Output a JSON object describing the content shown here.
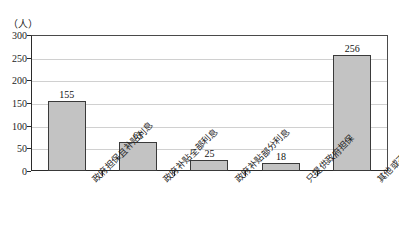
{
  "chart_data": {
    "type": "bar",
    "title": "",
    "subtitle": "",
    "xlabel": "",
    "ylabel": "",
    "unit_label": "（人）",
    "categories": [
      "政府担保且补贴利息",
      "政府补贴全部利息",
      "政府补贴部分利息",
      "只提供政府担保",
      "其他或不考虑"
    ],
    "values": [
      155,
      65,
      25,
      18,
      256
    ],
    "value_labels": [
      "155",
      "65",
      "25",
      "18",
      "256"
    ],
    "ylim": [
      0,
      300
    ],
    "yticks": [
      0,
      50,
      100,
      150,
      200,
      250,
      300
    ],
    "ytick_labels": [
      "0",
      "50",
      "100",
      "150",
      "200",
      "250",
      "300"
    ],
    "grid": true,
    "legend": "none",
    "bar_color": "#c3c3c3",
    "bar_border_color": "#3a3a3a",
    "grid_color": "#d0d0d0",
    "axis_color": "#2b2b2b"
  }
}
